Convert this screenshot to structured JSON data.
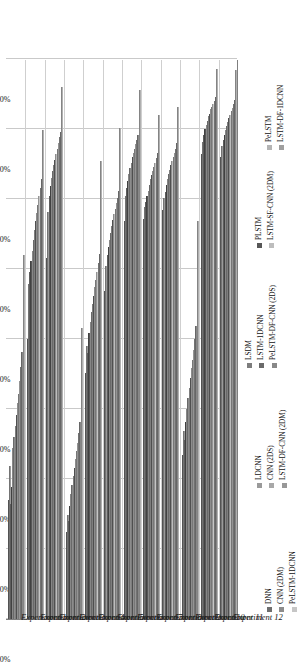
{
  "chart_data": {
    "type": "bar",
    "orientation": "horizontal",
    "title": "",
    "xlabel": "",
    "ylabel": "",
    "ylim": [
      60,
      100
    ],
    "grid": true,
    "legend_position": "bottom",
    "tick_labels": [
      "60. 00%",
      "65. 00%",
      "70. 00%",
      "75. 00%",
      "80. 00%",
      "85. 00%",
      "90. 00%",
      "95. 00%",
      "100. 00%"
    ],
    "tick_values": [
      60,
      65,
      70,
      75,
      80,
      85,
      90,
      95,
      100
    ],
    "categories": [
      "Experiment 1",
      "Experiment 2",
      "Experiment 3",
      "Experiment 4",
      "Experiment 5",
      "Experiment 6",
      "Experiment 7",
      "Experiment 8",
      "Experiment 9",
      "Experiment 10",
      "Experiment 11",
      "Experiment 12"
    ],
    "series": [
      {
        "name": "DNN",
        "color": "#6e6e6e",
        "values": [
          68.5,
          80.0,
          85.8,
          66.2,
          77.6,
          83.4,
          88.4,
          88.6,
          89.2,
          71.7,
          93.2,
          93.0
        ]
      },
      {
        "name": "LDCNN",
        "color": "#9a9a9a",
        "values": [
          70.9,
          83.9,
          89.1,
          67.4,
          79.5,
          85.2,
          90.2,
          89.4,
          90.1,
          73.4,
          94.1,
          93.8
        ]
      },
      {
        "name": "LSDM",
        "color": "#7d7d7d",
        "values": [
          68.2,
          84.8,
          90.2,
          67.0,
          79.0,
          86.0,
          90.8,
          89.8,
          90.5,
          72.8,
          94.6,
          94.2
        ]
      },
      {
        "name": "PLSTM",
        "color": "#575757",
        "values": [
          69.4,
          85.6,
          90.9,
          68.1,
          80.4,
          86.6,
          91.3,
          90.2,
          91.0,
          74.1,
          95.0,
          94.6
        ]
      },
      {
        "name": "PeLSTM",
        "color": "#b4b4b4",
        "values": [
          72.2,
          86.3,
          91.5,
          68.9,
          81.2,
          87.1,
          91.8,
          90.6,
          91.4,
          75.0,
          95.3,
          94.9
        ]
      },
      {
        "name": "CNN (2DM)",
        "color": "#8c8c8c",
        "values": [
          73.0,
          87.1,
          92.0,
          69.6,
          81.9,
          87.6,
          92.2,
          91.0,
          91.8,
          75.8,
          95.6,
          95.2
        ]
      },
      {
        "name": "CNN (2DS)",
        "color": "#a8a8a8",
        "values": [
          73.8,
          87.8,
          92.4,
          70.2,
          82.5,
          88.1,
          92.6,
          91.4,
          92.1,
          76.5,
          95.9,
          95.5
        ]
      },
      {
        "name": "LSTM-1DCNN",
        "color": "#6a6a6a",
        "values": [
          74.6,
          88.4,
          92.8,
          70.8,
          83.1,
          88.5,
          93.0,
          91.7,
          92.4,
          77.2,
          96.1,
          95.8
        ]
      },
      {
        "name": "LSTM-SF-CNN (2DM)",
        "color": "#bdbdbd",
        "values": [
          75.4,
          89.0,
          93.2,
          71.4,
          83.7,
          88.9,
          93.3,
          92.0,
          92.7,
          77.9,
          96.4,
          96.0
        ]
      },
      {
        "name": "LSTM-DF-1DCNN",
        "color": "#9f9f9f",
        "values": [
          76.1,
          89.6,
          93.6,
          72.0,
          84.2,
          89.3,
          93.6,
          92.3,
          93.0,
          78.5,
          96.6,
          96.3
        ]
      },
      {
        "name": "PeLSTM-1DCNN",
        "color": "#c6c6c6",
        "values": [
          77.0,
          90.2,
          94.0,
          72.6,
          84.8,
          89.7,
          93.9,
          92.6,
          93.3,
          79.2,
          96.8,
          96.5
        ]
      },
      {
        "name": "LSTM-DF-CNN (2DM)",
        "color": "#989898",
        "values": [
          78.0,
          90.8,
          94.4,
          73.3,
          85.4,
          90.1,
          94.2,
          92.9,
          93.6,
          80.0,
          97.0,
          96.8
        ]
      },
      {
        "name": "PeLSTM-DF-CNN (2DS)",
        "color": "#888888",
        "values": [
          79.1,
          91.4,
          94.8,
          74.1,
          86.1,
          90.6,
          94.6,
          93.3,
          94.0,
          80.9,
          97.3,
          97.1
        ]
      },
      {
        "name": "LSTM-DF-CNN (2DM) b",
        "color": "#b0b0b0",
        "values": [
          86.0,
          94.9,
          98.0,
          80.8,
          92.7,
          95.1,
          97.8,
          96.0,
          96.6,
          88.4,
          99.3,
          99.2
        ]
      }
    ],
    "legend_columns": [
      {
        "items": [
          "DNN",
          "CNN (2DM)",
          "PeLSTM-1DCNN"
        ]
      },
      {
        "items": [
          "LDCNN",
          "CNN (2DS)",
          "LSTM-DF-CNN (2DM)"
        ]
      },
      {
        "items": [
          "LSDM",
          "LSTM-1DCNN",
          "PeLSTM-DF-CNN (2DS)"
        ]
      },
      {
        "items": [
          "PLSTM",
          "LSTM-SF-CNN (2DM)"
        ]
      },
      {
        "items": [
          "PeLSTM",
          "LSTM-DF-1DCNN"
        ]
      }
    ]
  }
}
